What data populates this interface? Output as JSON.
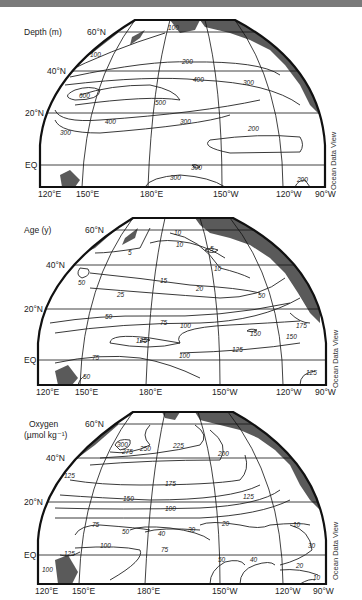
{
  "figure": {
    "credit": "Ocean Data View",
    "lon_ticks": [
      "120°E",
      "150°E",
      "180°E",
      "150°W",
      "120°W",
      "90°W"
    ],
    "lat_ticks": [
      "60°N",
      "40°N",
      "20°N",
      "EQ"
    ]
  },
  "panels": [
    {
      "variable": "Depth (m)",
      "contour_labels": [
        "100",
        "100",
        "200",
        "400",
        "300",
        "600",
        "500",
        "400",
        "300",
        "300",
        "200",
        "300",
        "300",
        "200"
      ]
    },
    {
      "variable": "Age (y)",
      "contour_labels": [
        "5",
        "10",
        "10",
        "5",
        "10",
        "50",
        "15",
        "20",
        "25",
        "50",
        "50",
        "75",
        "100",
        "125",
        "150",
        "175",
        "150",
        "125",
        "100",
        "75",
        "125",
        "50"
      ]
    },
    {
      "variable": "Oxygen",
      "variable_unit": "(µmol kg⁻¹)",
      "contour_labels": [
        "300",
        "275",
        "250",
        "225",
        "200",
        "125",
        "175",
        "150",
        "125",
        "100",
        "75",
        "50",
        "40",
        "30",
        "20",
        "10",
        "100",
        "75",
        "125",
        "50",
        "40",
        "30",
        "20",
        "10",
        "100"
      ]
    }
  ],
  "colors": {
    "land": "#5a5a5a",
    "frame": "#111111",
    "contour": "#222222",
    "grid": "#111111",
    "topband": "#7a7a7a"
  }
}
